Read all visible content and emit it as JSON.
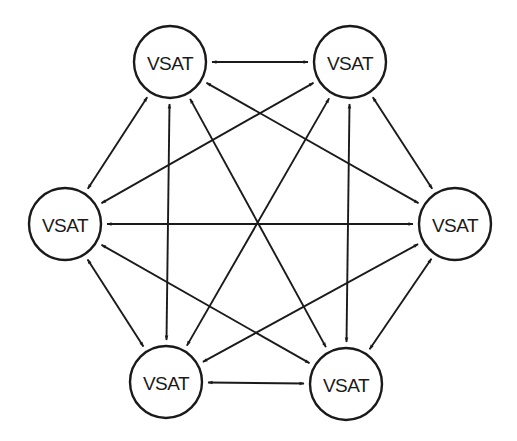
{
  "diagram": {
    "type": "fully-meshed network",
    "colors": {
      "stroke": "#1a1a1a",
      "background": "#ffffff"
    },
    "node_radius": 36,
    "nodes": [
      {
        "id": "top-left",
        "label": "VSAT",
        "x": 170,
        "y": 62
      },
      {
        "id": "top-right",
        "label": "VSAT",
        "x": 350,
        "y": 62
      },
      {
        "id": "left",
        "label": "VSAT",
        "x": 65,
        "y": 224
      },
      {
        "id": "right",
        "label": "VSAT",
        "x": 455,
        "y": 224
      },
      {
        "id": "bottom-left",
        "label": "VSAT",
        "x": 166,
        "y": 382
      },
      {
        "id": "bottom-right",
        "label": "VSAT",
        "x": 346,
        "y": 384
      }
    ],
    "links": [
      {
        "from": "top-left",
        "to": "top-right",
        "bidirectional": true
      },
      {
        "from": "top-left",
        "to": "left",
        "bidirectional": true
      },
      {
        "from": "top-left",
        "to": "right",
        "bidirectional": true
      },
      {
        "from": "top-left",
        "to": "bottom-left",
        "bidirectional": true
      },
      {
        "from": "top-left",
        "to": "bottom-right",
        "bidirectional": true
      },
      {
        "from": "top-right",
        "to": "left",
        "bidirectional": true
      },
      {
        "from": "top-right",
        "to": "right",
        "bidirectional": true
      },
      {
        "from": "top-right",
        "to": "bottom-left",
        "bidirectional": true
      },
      {
        "from": "top-right",
        "to": "bottom-right",
        "bidirectional": true
      },
      {
        "from": "left",
        "to": "right",
        "bidirectional": true
      },
      {
        "from": "left",
        "to": "bottom-left",
        "bidirectional": true
      },
      {
        "from": "left",
        "to": "bottom-right",
        "bidirectional": true
      },
      {
        "from": "right",
        "to": "bottom-left",
        "bidirectional": true
      },
      {
        "from": "right",
        "to": "bottom-right",
        "bidirectional": true
      },
      {
        "from": "bottom-left",
        "to": "bottom-right",
        "bidirectional": true
      }
    ]
  }
}
